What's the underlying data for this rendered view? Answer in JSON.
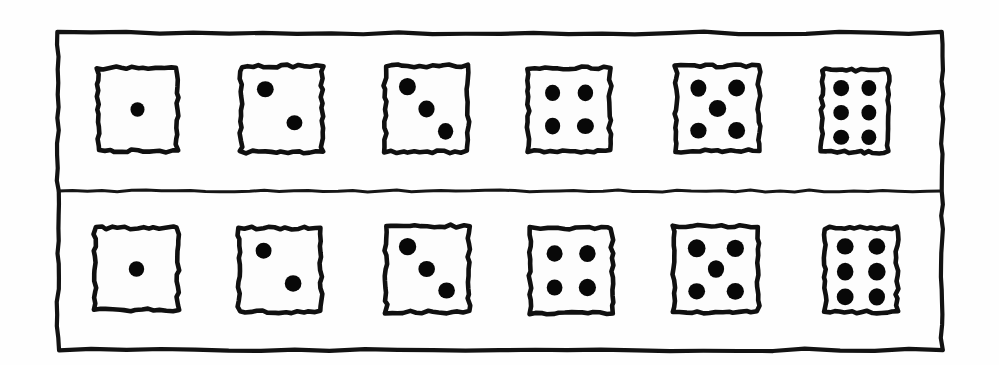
{
  "figure": {
    "kind": "dice-faces-illustration",
    "style": "hand-drawn ink line art",
    "background_color": "#fefefe",
    "ink_color": "#101010",
    "pip_color": "#080808",
    "frame": {
      "label": "outer-frame",
      "x": 58,
      "y": 33,
      "width": 884,
      "height": 317,
      "divider_y": 191
    },
    "rows": [
      {
        "name": "top-row",
        "label": "Top row of dice",
        "dice": [
          {
            "value": 1,
            "label": "die-one",
            "box": {
              "x": 98,
              "y": 68,
              "w": 79,
              "h": 83
            },
            "pips": [
              {
                "cx": 0.5,
                "cy": 0.5,
                "r": 0.09
              }
            ]
          },
          {
            "value": 2,
            "label": "die-two",
            "box": {
              "x": 241,
              "y": 66,
              "w": 81,
              "h": 86
            },
            "pips": [
              {
                "cx": 0.3,
                "cy": 0.27,
                "r": 0.098
              },
              {
                "cx": 0.66,
                "cy": 0.66,
                "r": 0.098
              }
            ]
          },
          {
            "value": 3,
            "label": "die-three",
            "box": {
              "x": 385,
              "y": 66,
              "w": 83,
              "h": 86
            },
            "pips": [
              {
                "cx": 0.27,
                "cy": 0.24,
                "r": 0.098
              },
              {
                "cx": 0.5,
                "cy": 0.5,
                "r": 0.098
              },
              {
                "cx": 0.73,
                "cy": 0.76,
                "r": 0.098
              }
            ]
          },
          {
            "value": 4,
            "label": "die-four",
            "box": {
              "x": 528,
              "y": 68,
              "w": 82,
              "h": 83
            },
            "pips": [
              {
                "cx": 0.3,
                "cy": 0.3,
                "r": 0.098
              },
              {
                "cx": 0.7,
                "cy": 0.3,
                "r": 0.098
              },
              {
                "cx": 0.3,
                "cy": 0.7,
                "r": 0.098
              },
              {
                "cx": 0.7,
                "cy": 0.7,
                "r": 0.098
              }
            ]
          },
          {
            "value": 5,
            "label": "die-five",
            "box": {
              "x": 676,
              "y": 66,
              "w": 83,
              "h": 85
            },
            "pips": [
              {
                "cx": 0.27,
                "cy": 0.26,
                "r": 0.1
              },
              {
                "cx": 0.73,
                "cy": 0.26,
                "r": 0.1
              },
              {
                "cx": 0.5,
                "cy": 0.5,
                "r": 0.1
              },
              {
                "cx": 0.27,
                "cy": 0.76,
                "r": 0.1
              },
              {
                "cx": 0.73,
                "cy": 0.76,
                "r": 0.1
              }
            ]
          },
          {
            "value": 6,
            "label": "die-six",
            "box": {
              "x": 822,
              "y": 70,
              "w": 66,
              "h": 82
            },
            "pips": [
              {
                "cx": 0.29,
                "cy": 0.22,
                "r": 0.118
              },
              {
                "cx": 0.71,
                "cy": 0.22,
                "r": 0.118
              },
              {
                "cx": 0.29,
                "cy": 0.52,
                "r": 0.118
              },
              {
                "cx": 0.71,
                "cy": 0.52,
                "r": 0.118
              },
              {
                "cx": 0.29,
                "cy": 0.82,
                "r": 0.118
              },
              {
                "cx": 0.71,
                "cy": 0.82,
                "r": 0.118
              }
            ]
          }
        ]
      },
      {
        "name": "bottom-row",
        "label": "Bottom row of dice",
        "dice": [
          {
            "value": 1,
            "label": "die-one",
            "box": {
              "x": 95,
              "y": 228,
              "w": 83,
              "h": 82
            },
            "pips": [
              {
                "cx": 0.5,
                "cy": 0.5,
                "r": 0.09
              }
            ]
          },
          {
            "value": 2,
            "label": "die-two",
            "box": {
              "x": 239,
              "y": 228,
              "w": 82,
              "h": 84
            },
            "pips": [
              {
                "cx": 0.3,
                "cy": 0.27,
                "r": 0.098
              },
              {
                "cx": 0.66,
                "cy": 0.66,
                "r": 0.098
              }
            ]
          },
          {
            "value": 3,
            "label": "die-three",
            "box": {
              "x": 386,
              "y": 226,
              "w": 83,
              "h": 86
            },
            "pips": [
              {
                "cx": 0.26,
                "cy": 0.24,
                "r": 0.1
              },
              {
                "cx": 0.49,
                "cy": 0.5,
                "r": 0.1
              },
              {
                "cx": 0.73,
                "cy": 0.75,
                "r": 0.1
              }
            ]
          },
          {
            "value": 4,
            "label": "die-four",
            "box": {
              "x": 530,
              "y": 228,
              "w": 82,
              "h": 85
            },
            "pips": [
              {
                "cx": 0.3,
                "cy": 0.3,
                "r": 0.1
              },
              {
                "cx": 0.7,
                "cy": 0.3,
                "r": 0.1
              },
              {
                "cx": 0.3,
                "cy": 0.7,
                "r": 0.1
              },
              {
                "cx": 0.7,
                "cy": 0.7,
                "r": 0.1
              }
            ]
          },
          {
            "value": 5,
            "label": "die-five",
            "box": {
              "x": 674,
              "y": 226,
              "w": 84,
              "h": 86
            },
            "pips": [
              {
                "cx": 0.27,
                "cy": 0.26,
                "r": 0.102
              },
              {
                "cx": 0.73,
                "cy": 0.26,
                "r": 0.102
              },
              {
                "cx": 0.5,
                "cy": 0.5,
                "r": 0.102
              },
              {
                "cx": 0.27,
                "cy": 0.76,
                "r": 0.102
              },
              {
                "cx": 0.73,
                "cy": 0.76,
                "r": 0.102
              }
            ]
          },
          {
            "value": 6,
            "label": "die-six",
            "box": {
              "x": 825,
              "y": 228,
              "w": 72,
              "h": 84
            },
            "pips": [
              {
                "cx": 0.28,
                "cy": 0.22,
                "r": 0.118
              },
              {
                "cx": 0.72,
                "cy": 0.22,
                "r": 0.118
              },
              {
                "cx": 0.28,
                "cy": 0.52,
                "r": 0.118
              },
              {
                "cx": 0.72,
                "cy": 0.52,
                "r": 0.118
              },
              {
                "cx": 0.28,
                "cy": 0.82,
                "r": 0.118
              },
              {
                "cx": 0.72,
                "cy": 0.82,
                "r": 0.118
              }
            ]
          }
        ]
      }
    ]
  }
}
